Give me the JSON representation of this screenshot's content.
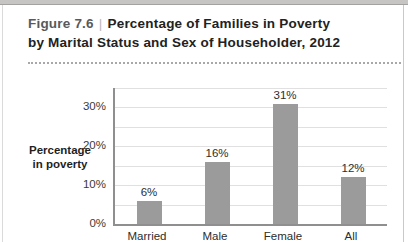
{
  "figure": {
    "label": "Figure 7.6",
    "separator": "|",
    "title_line1": "Percentage of Families in Poverty",
    "title_line2": "by Marital Status and Sex of Householder, 2012"
  },
  "chart_data": {
    "type": "bar",
    "title": "Percentage of Families in Poverty by Marital Status and Sex of Householder, 2012",
    "categories": [
      "Married",
      "Male",
      "Female",
      "All"
    ],
    "values": [
      6,
      16,
      31,
      12
    ],
    "value_labels": [
      "6%",
      "16%",
      "31%",
      "12%"
    ],
    "ylabel": "Percentage in poverty",
    "ylabel_lines": [
      "Percentage",
      "in poverty"
    ],
    "xlabel": "",
    "ylim": [
      0,
      35
    ],
    "yticks": [
      0,
      10,
      20,
      30
    ],
    "ytick_labels": [
      "0%",
      "10%",
      "20%",
      "30%"
    ],
    "gridline_step": 5,
    "grid": true,
    "legend": false
  },
  "colors": {
    "bar": "#9b9b9b",
    "gridline": "#e0e0e0",
    "axis": "#8f8f8f",
    "figure_label": "#595959",
    "title_text": "#222222",
    "top_strip": "#c6c5c3",
    "panel_border": "#c9c9c9"
  }
}
